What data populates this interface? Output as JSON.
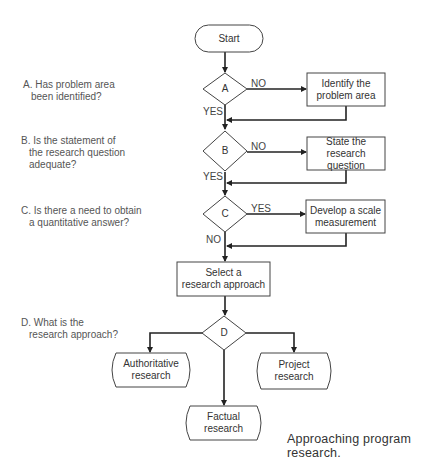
{
  "diagram": {
    "type": "flowchart",
    "nodes": {
      "start": {
        "label": "Start"
      },
      "A": {
        "label": "A"
      },
      "B": {
        "label": "B"
      },
      "C": {
        "label": "C"
      },
      "D": {
        "label": "D"
      },
      "identify": {
        "line1": "Identify the",
        "line2": "problem area"
      },
      "state": {
        "line1": "State the",
        "line2": "research question"
      },
      "develop": {
        "line1": "Develop a scale",
        "line2": "measurement"
      },
      "select": {
        "line1": "Select a",
        "line2": "research approach"
      },
      "authoritative": {
        "line1": "Authoritative",
        "line2": "research"
      },
      "project": {
        "line1": "Project",
        "line2": "research"
      },
      "factual": {
        "line1": "Factual",
        "line2": "research"
      }
    },
    "edge_labels": {
      "a_no": "NO",
      "a_yes": "YES",
      "b_no": "NO",
      "b_yes": "YES",
      "c_yes": "YES",
      "c_no": "NO"
    },
    "questions": {
      "A": {
        "line1": "A. Has problem area",
        "line2": "been identified?"
      },
      "B": {
        "line1": "B. Is the statement of",
        "line2": "the research question",
        "line3": "adequate?"
      },
      "C": {
        "line1": "C. Is there a need to obtain",
        "line2": "a quantitative answer?"
      },
      "D": {
        "line1": "D. What is the",
        "line2": "research approach?"
      }
    },
    "caption": "Approaching program research."
  }
}
